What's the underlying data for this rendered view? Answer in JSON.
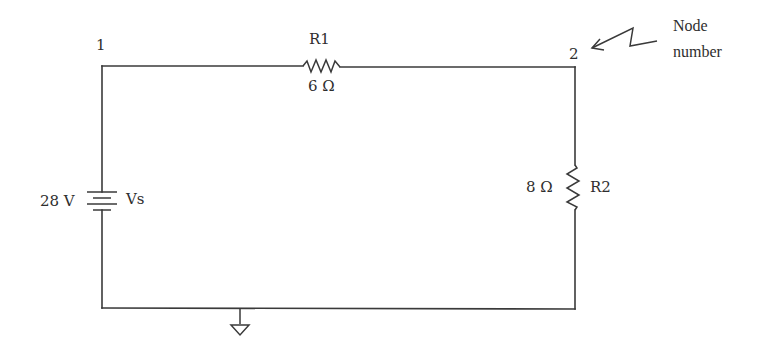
{
  "circuit": {
    "nodes": [
      {
        "id": "1",
        "label": "1"
      },
      {
        "id": "2",
        "label": "2"
      }
    ],
    "source": {
      "name": "Vs",
      "value": "28 V",
      "type": "dc-voltage-source"
    },
    "resistors": [
      {
        "name": "R1",
        "value": "6 Ω",
        "between": [
          "1",
          "2"
        ]
      },
      {
        "name": "R2",
        "value": "8 Ω",
        "between": [
          "2",
          "ground"
        ]
      }
    ],
    "ground": {
      "symbol": "ground"
    },
    "annotation": {
      "line1": "Node",
      "line2": "number"
    }
  },
  "colors": {
    "line": "#3a3a3a",
    "text": "#2e2e2e",
    "background": "#ffffff"
  }
}
